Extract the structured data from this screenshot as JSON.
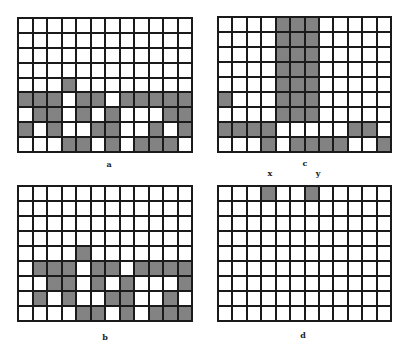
{
  "grids": {
    "a": {
      "label": "a",
      "rows": 9,
      "cols": 12,
      "shaded": [
        [
          4,
          3
        ],
        [
          5,
          0
        ],
        [
          5,
          1
        ],
        [
          5,
          2
        ],
        [
          5,
          4
        ],
        [
          5,
          5
        ],
        [
          5,
          7
        ],
        [
          5,
          8
        ],
        [
          5,
          9
        ],
        [
          5,
          10
        ],
        [
          5,
          11
        ],
        [
          6,
          1
        ],
        [
          6,
          2
        ],
        [
          6,
          4
        ],
        [
          6,
          6
        ],
        [
          6,
          10
        ],
        [
          6,
          11
        ],
        [
          7,
          0
        ],
        [
          7,
          2
        ],
        [
          7,
          5
        ],
        [
          7,
          6
        ],
        [
          7,
          9
        ],
        [
          7,
          11
        ],
        [
          8,
          3
        ],
        [
          8,
          4
        ],
        [
          8,
          6
        ],
        [
          8,
          8
        ],
        [
          8,
          9
        ],
        [
          8,
          10
        ]
      ]
    },
    "b": {
      "label": "b",
      "rows": 9,
      "cols": 12,
      "shaded": [
        [
          4,
          4
        ],
        [
          5,
          1
        ],
        [
          5,
          2
        ],
        [
          5,
          3
        ],
        [
          5,
          5
        ],
        [
          5,
          6
        ],
        [
          5,
          8
        ],
        [
          5,
          9
        ],
        [
          5,
          10
        ],
        [
          5,
          11
        ],
        [
          6,
          2
        ],
        [
          6,
          3
        ],
        [
          6,
          5
        ],
        [
          6,
          7
        ],
        [
          6,
          11
        ],
        [
          7,
          1
        ],
        [
          7,
          3
        ],
        [
          7,
          6
        ],
        [
          7,
          7
        ],
        [
          7,
          10
        ],
        [
          8,
          4
        ],
        [
          8,
          5
        ],
        [
          8,
          7
        ],
        [
          8,
          9
        ],
        [
          8,
          10
        ],
        [
          8,
          11
        ]
      ]
    },
    "c": {
      "label": "c",
      "rows": 9,
      "cols": 12,
      "shaded": [
        [
          0,
          4
        ],
        [
          0,
          5
        ],
        [
          0,
          6
        ],
        [
          1,
          4
        ],
        [
          1,
          5
        ],
        [
          1,
          6
        ],
        [
          2,
          4
        ],
        [
          2,
          5
        ],
        [
          2,
          6
        ],
        [
          3,
          4
        ],
        [
          3,
          5
        ],
        [
          3,
          6
        ],
        [
          4,
          4
        ],
        [
          4,
          5
        ],
        [
          4,
          6
        ],
        [
          5,
          0
        ],
        [
          5,
          4
        ],
        [
          5,
          5
        ],
        [
          5,
          6
        ],
        [
          6,
          4
        ],
        [
          6,
          5
        ],
        [
          6,
          6
        ],
        [
          7,
          0
        ],
        [
          7,
          1
        ],
        [
          7,
          2
        ],
        [
          7,
          3
        ],
        [
          7,
          9
        ],
        [
          7,
          10
        ],
        [
          8,
          3
        ],
        [
          8,
          5
        ],
        [
          8,
          6
        ],
        [
          8,
          7
        ],
        [
          8,
          8
        ],
        [
          8,
          11
        ]
      ]
    },
    "d": {
      "label": "d",
      "rows": 9,
      "cols": 12,
      "shaded": [
        [
          0,
          3
        ],
        [
          0,
          6
        ]
      ]
    }
  },
  "axis_labels": {
    "x": "x",
    "y": "y"
  },
  "colors": {
    "line": "#1a1a1a",
    "shade": "#a9a9a9",
    "background": "#ffffff"
  }
}
